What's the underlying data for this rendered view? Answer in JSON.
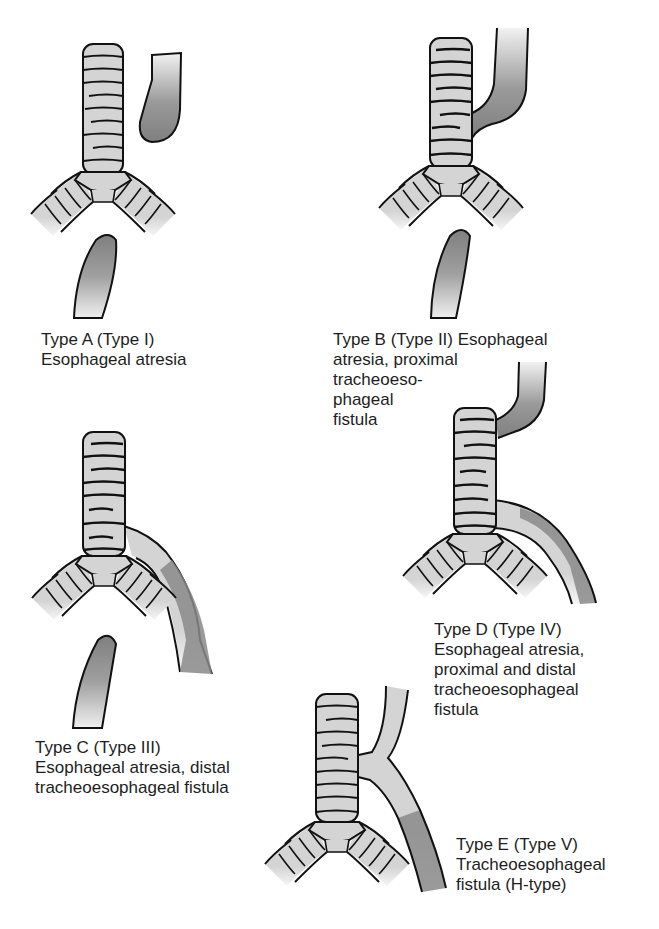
{
  "figure": {
    "colors": {
      "trachea_fill": "#d4d4d4",
      "outline": "#111111",
      "esophagus_dark": "#8a8a8a",
      "esophagus_light": "#e6e6e6",
      "background": "#ffffff"
    },
    "panels": [
      {
        "id": "A",
        "lines": [
          "Type A (Type I)",
          "Esophageal atresia"
        ]
      },
      {
        "id": "B",
        "lines": [
          "Type B (Type II) Esophageal",
          "atresia, proximal",
          "tracheoeso-",
          "phageal",
          "fistula"
        ]
      },
      {
        "id": "C",
        "lines": [
          "Type C (Type III)",
          "Esophageal atresia, distal",
          "tracheoesophageal fistula"
        ]
      },
      {
        "id": "D",
        "lines": [
          "Type D (Type IV)",
          "Esophageal atresia,",
          "proximal and distal",
          "tracheoesophageal",
          "fistula"
        ]
      },
      {
        "id": "E",
        "lines": [
          "Type E (Type V)",
          "Tracheoesophageal",
          "fistula (H-type)"
        ]
      }
    ]
  }
}
